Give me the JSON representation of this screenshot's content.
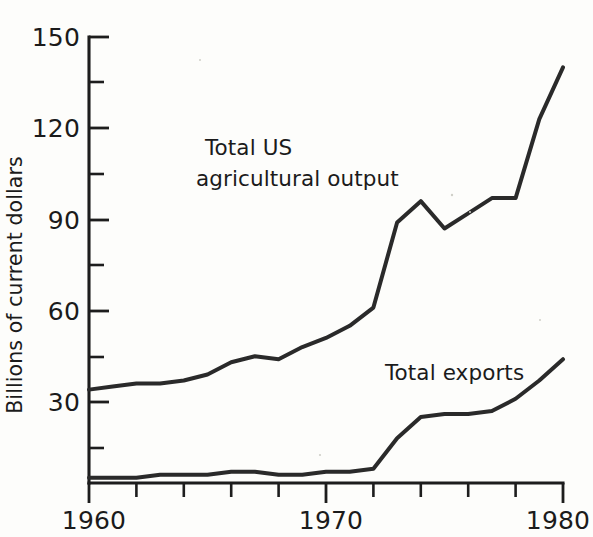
{
  "chart_data": {
    "type": "line",
    "title": "",
    "subtitle": "",
    "xlabel": "",
    "ylabel": "Billions of current dollars",
    "xlim": [
      1960,
      1980
    ],
    "ylim": [
      0,
      150
    ],
    "grid": false,
    "legend_position": "inline-annotations",
    "x_tick_labels": [
      "1960",
      "1970",
      "1980"
    ],
    "x_ticks_major": [
      1960,
      1970,
      1980
    ],
    "x_ticks_minor": [
      1962,
      1964,
      1966,
      1968,
      1972,
      1974,
      1976,
      1978
    ],
    "y_tick_labels": [
      "30",
      "60",
      "90",
      "120",
      "150"
    ],
    "y_ticks_major": [
      30,
      60,
      90,
      120,
      150
    ],
    "y_ticks_minor": [
      15,
      45,
      75,
      105,
      135
    ],
    "x": [
      1960,
      1961,
      1962,
      1963,
      1964,
      1965,
      1966,
      1967,
      1968,
      1969,
      1970,
      1971,
      1972,
      1973,
      1974,
      1975,
      1976,
      1977,
      1978,
      1979,
      1980
    ],
    "series": [
      {
        "name": "Total US agricultural output",
        "label_line1": "Total US",
        "label_line2": "agricultural output",
        "color": "#2a2a2a",
        "values": [
          34,
          35,
          36,
          36,
          37,
          39,
          43,
          45,
          44,
          48,
          51,
          55,
          61,
          89,
          96,
          87,
          92,
          97,
          97,
          123,
          140
        ]
      },
      {
        "name": "Total exports",
        "label_line1": "Total exports",
        "label_line2": "",
        "color": "#2a2a2a",
        "values": [
          5,
          5,
          5,
          6,
          6,
          6,
          7,
          7,
          6,
          6,
          7,
          7,
          8,
          18,
          25,
          26,
          26,
          27,
          31,
          37,
          44
        ]
      }
    ]
  },
  "annotations": {
    "series1_label_line1": "Total US",
    "series1_label_line2": "agricultural output",
    "series2_label": "Total exports"
  },
  "axes": {
    "y_axis_title": "Billions of current dollars",
    "x_labels": {
      "start": "1960",
      "middle": "1970",
      "end": "1980"
    },
    "y_labels": {
      "l30": "30",
      "l60": "60",
      "l90": "90",
      "l120": "120",
      "l150": "150"
    }
  }
}
